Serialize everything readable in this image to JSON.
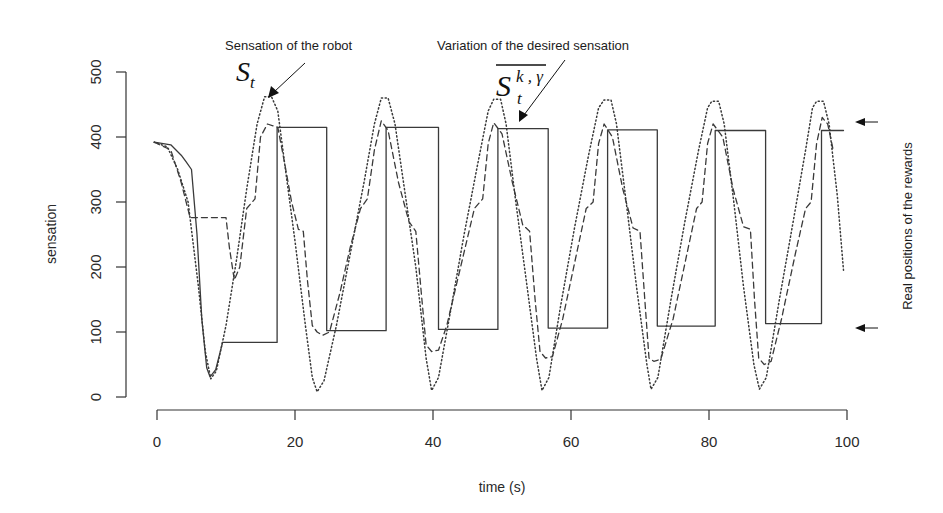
{
  "chart_data": {
    "type": "line",
    "title": "",
    "xlabel": "time (s)",
    "ylabel": "sensation",
    "xlim": [
      0,
      100
    ],
    "ylim": [
      0,
      500
    ],
    "x_ticks": [
      0,
      20,
      40,
      60,
      80,
      100
    ],
    "y_ticks": [
      0,
      100,
      200,
      300,
      400,
      500
    ],
    "grid": false,
    "legend": null,
    "series": [
      {
        "name": "Variation of the desired sensation (step)",
        "style": "solid",
        "points": [
          [
            -0.4,
            392
          ],
          [
            2,
            388
          ],
          [
            3.5,
            372
          ],
          [
            4.2,
            362
          ],
          [
            5,
            350
          ],
          [
            5.8,
            250
          ],
          [
            6.5,
            120
          ],
          [
            7.2,
            45
          ],
          [
            7.7,
            31
          ],
          [
            8.5,
            42
          ],
          [
            9.5,
            84
          ],
          [
            17.4,
            84
          ],
          [
            17.4,
            415
          ],
          [
            24.6,
            415
          ],
          [
            24.6,
            102
          ],
          [
            33.2,
            102
          ],
          [
            33.2,
            415
          ],
          [
            40.8,
            415
          ],
          [
            40.8,
            104
          ],
          [
            49.4,
            104
          ],
          [
            49.4,
            413
          ],
          [
            56.7,
            413
          ],
          [
            56.7,
            106
          ],
          [
            65.3,
            106
          ],
          [
            65.3,
            411
          ],
          [
            72.5,
            411
          ],
          [
            72.5,
            109
          ],
          [
            80.9,
            109
          ],
          [
            80.9,
            410
          ],
          [
            88.2,
            410
          ],
          [
            88.2,
            113
          ],
          [
            96.3,
            113
          ],
          [
            96.3,
            410
          ],
          [
            99.5,
            410
          ]
        ]
      },
      {
        "name": "Sensation of the robot S_t",
        "style": "dotted",
        "points": [
          [
            -0.4,
            392
          ],
          [
            1.5,
            385
          ],
          [
            3,
            350
          ],
          [
            4.5,
            300
          ],
          [
            6,
            170
          ],
          [
            7,
            70
          ],
          [
            7.8,
            28
          ],
          [
            8.6,
            40
          ],
          [
            10,
            110
          ],
          [
            11.5,
            210
          ],
          [
            13,
            320
          ],
          [
            14.5,
            420
          ],
          [
            15.6,
            462
          ],
          [
            16.6,
            462
          ],
          [
            17.5,
            440
          ],
          [
            18.5,
            360
          ],
          [
            20,
            240
          ],
          [
            21.5,
            110
          ],
          [
            22.5,
            30
          ],
          [
            23.2,
            8
          ],
          [
            24.2,
            25
          ],
          [
            26,
            110
          ],
          [
            28,
            220
          ],
          [
            30,
            330
          ],
          [
            31.5,
            420
          ],
          [
            32.5,
            460
          ],
          [
            33.5,
            460
          ],
          [
            34.5,
            420
          ],
          [
            36,
            310
          ],
          [
            37.5,
            200
          ],
          [
            39,
            60
          ],
          [
            39.8,
            10
          ],
          [
            40.8,
            30
          ],
          [
            42.5,
            130
          ],
          [
            44.5,
            250
          ],
          [
            46.5,
            360
          ],
          [
            48,
            440
          ],
          [
            48.8,
            458
          ],
          [
            49.8,
            458
          ],
          [
            50.6,
            420
          ],
          [
            52,
            300
          ],
          [
            53.5,
            180
          ],
          [
            55,
            60
          ],
          [
            55.8,
            10
          ],
          [
            56.8,
            30
          ],
          [
            58.5,
            140
          ],
          [
            60.5,
            260
          ],
          [
            62.5,
            370
          ],
          [
            64,
            445
          ],
          [
            64.8,
            457
          ],
          [
            65.8,
            457
          ],
          [
            66.6,
            420
          ],
          [
            68,
            300
          ],
          [
            69.5,
            170
          ],
          [
            71,
            50
          ],
          [
            71.6,
            12
          ],
          [
            72.6,
            30
          ],
          [
            74.5,
            150
          ],
          [
            76.5,
            270
          ],
          [
            78.5,
            380
          ],
          [
            79.8,
            445
          ],
          [
            80.4,
            455
          ],
          [
            81.4,
            455
          ],
          [
            82.2,
            420
          ],
          [
            83.6,
            300
          ],
          [
            85,
            170
          ],
          [
            86.5,
            50
          ],
          [
            87.3,
            12
          ],
          [
            88.3,
            30
          ],
          [
            90.2,
            150
          ],
          [
            92.2,
            270
          ],
          [
            94,
            380
          ],
          [
            95,
            445
          ],
          [
            95.6,
            455
          ],
          [
            96.6,
            455
          ],
          [
            97.4,
            420
          ],
          [
            98.6,
            310
          ],
          [
            99.5,
            195
          ]
        ]
      },
      {
        "name": "Desired sensation (dashed)",
        "style": "dashed",
        "points": [
          [
            -0.4,
            392
          ],
          [
            2,
            380
          ],
          [
            3.5,
            330
          ],
          [
            4.8,
            276
          ],
          [
            10,
            276
          ],
          [
            10.5,
            230
          ],
          [
            11.2,
            180
          ],
          [
            12,
            200
          ],
          [
            13,
            290
          ],
          [
            14.2,
            305
          ],
          [
            15,
            400
          ],
          [
            16,
            420
          ],
          [
            17.5,
            415
          ],
          [
            18.5,
            360
          ],
          [
            19.5,
            300
          ],
          [
            20.5,
            258
          ],
          [
            21.2,
            255
          ],
          [
            21.8,
            180
          ],
          [
            22.5,
            110
          ],
          [
            23.2,
            100
          ],
          [
            24,
            95
          ],
          [
            25,
            100
          ],
          [
            26.5,
            160
          ],
          [
            28,
            230
          ],
          [
            29.5,
            290
          ],
          [
            30.5,
            305
          ],
          [
            31.5,
            380
          ],
          [
            32.5,
            425
          ],
          [
            33.5,
            410
          ],
          [
            35,
            330
          ],
          [
            36.5,
            270
          ],
          [
            37.5,
            255
          ],
          [
            38.3,
            160
          ],
          [
            39,
            80
          ],
          [
            39.8,
            70
          ],
          [
            40.8,
            72
          ],
          [
            42,
            110
          ],
          [
            44,
            200
          ],
          [
            46,
            290
          ],
          [
            47.2,
            305
          ],
          [
            48,
            390
          ],
          [
            48.8,
            422
          ],
          [
            50,
            405
          ],
          [
            51.5,
            330
          ],
          [
            53,
            265
          ],
          [
            54,
            255
          ],
          [
            54.8,
            150
          ],
          [
            55.5,
            70
          ],
          [
            56.3,
            60
          ],
          [
            57.3,
            62
          ],
          [
            58.8,
            120
          ],
          [
            60.8,
            220
          ],
          [
            62.2,
            290
          ],
          [
            63.2,
            300
          ],
          [
            64,
            390
          ],
          [
            64.8,
            420
          ],
          [
            66,
            400
          ],
          [
            67.5,
            320
          ],
          [
            69,
            260
          ],
          [
            70,
            255
          ],
          [
            70.7,
            150
          ],
          [
            71.3,
            60
          ],
          [
            72,
            55
          ],
          [
            73,
            58
          ],
          [
            74.8,
            120
          ],
          [
            76.8,
            220
          ],
          [
            78.2,
            290
          ],
          [
            79,
            300
          ],
          [
            79.8,
            390
          ],
          [
            80.6,
            420
          ],
          [
            82,
            400
          ],
          [
            83.5,
            320
          ],
          [
            85,
            262
          ],
          [
            86,
            258
          ],
          [
            86.6,
            150
          ],
          [
            87.2,
            60
          ],
          [
            88,
            50
          ],
          [
            89,
            55
          ],
          [
            90.5,
            120
          ],
          [
            92.5,
            220
          ],
          [
            94,
            290
          ],
          [
            94.8,
            300
          ],
          [
            95.6,
            390
          ],
          [
            96.4,
            430
          ],
          [
            97.2,
            420
          ],
          [
            98,
            380
          ]
        ]
      }
    ],
    "annotations": [
      {
        "text": "Sensation of the robot",
        "symbol": "S_t",
        "target": [
          15.8,
          463
        ]
      },
      {
        "text": "Variation of the desired sensation",
        "symbol": "overline{S_t^{k,γ}}",
        "target": [
          51,
          416
        ]
      },
      {
        "text": "Real positions of the rewards",
        "marks": [
          420,
          108
        ]
      }
    ]
  },
  "labels": {
    "xlabel": "time (s)",
    "ylabel": "sensation",
    "annot_robot": "Sensation of the robot",
    "annot_robot_sym": "S",
    "annot_robot_sub": "t",
    "annot_desired": "Variation of the desired sensation",
    "annot_desired_sym": "S",
    "annot_desired_sub": "t",
    "annot_desired_sup": "k , γ",
    "annot_rewards": "Real positions of the rewards"
  },
  "colors": {
    "ink": "#2a2a2a",
    "solid": "#3a3a3a",
    "dotted": "#3a3a3a",
    "dashed": "#3a3a3a",
    "background": "#ffffff"
  }
}
